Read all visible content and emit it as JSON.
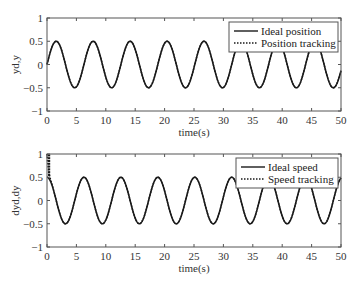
{
  "chart_data": [
    {
      "type": "line",
      "title": "",
      "xlabel": "time(s)",
      "ylabel": "yd,y",
      "xlim": [
        0,
        50
      ],
      "ylim": [
        -1,
        1
      ],
      "xticks": [
        0,
        5,
        10,
        15,
        20,
        25,
        30,
        35,
        40,
        45,
        50
      ],
      "yticks": [
        -1,
        -0.5,
        0,
        0.5,
        1
      ],
      "ytick_labels": [
        "−1",
        "−0.5",
        "0",
        "0.5",
        "1"
      ],
      "grid": false,
      "legend_position": "upper right",
      "series": [
        {
          "name": "Ideal position",
          "style": "solid",
          "function": "0.5*sin(t)",
          "amplitude": 0.5,
          "period": 6.283
        },
        {
          "name": "Position tracking",
          "style": "dotted",
          "function": "0.5*sin(t)",
          "amplitude": 0.5,
          "period": 6.283
        }
      ]
    },
    {
      "type": "line",
      "title": "",
      "xlabel": "time(s)",
      "ylabel": "dyd,dy",
      "xlim": [
        0,
        50
      ],
      "ylim": [
        -1,
        1
      ],
      "xticks": [
        0,
        5,
        10,
        15,
        20,
        25,
        30,
        35,
        40,
        45,
        50
      ],
      "yticks": [
        -1,
        -0.5,
        0,
        0.5,
        1
      ],
      "ytick_labels": [
        "−1",
        "−0.5",
        "0",
        "0.5",
        "1"
      ],
      "grid": false,
      "legend_position": "upper right",
      "series": [
        {
          "name": "Ideal speed",
          "style": "solid",
          "function": "0.5*cos(t)",
          "amplitude": 0.5,
          "period": 6.283
        },
        {
          "name": "Speed tracking",
          "style": "dotted",
          "function": "0.5*cos(t) with initial transient from 1.0 converging by t~1",
          "initial_value": 1.0,
          "amplitude": 0.5,
          "period": 6.283
        }
      ]
    }
  ],
  "colors": {
    "line": "#1a1a1a",
    "axis": "#555555",
    "background": "#ffffff"
  }
}
